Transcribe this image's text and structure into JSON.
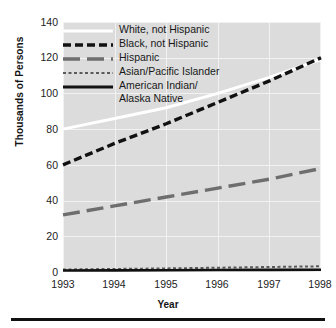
{
  "chart_data": {
    "type": "line",
    "title": "",
    "xlabel": "Year",
    "ylabel": "Thousands of Persons",
    "x": [
      1993,
      1994,
      1995,
      1996,
      1997,
      1998
    ],
    "xtick_labels": [
      "1993",
      "1994",
      "1995",
      "1996",
      "1997",
      "1998"
    ],
    "ytick_labels": [
      "0",
      "20",
      "40",
      "60",
      "80",
      "100",
      "120",
      "140"
    ],
    "yticks": [
      0,
      20,
      40,
      60,
      80,
      100,
      120,
      140
    ],
    "ylim": [
      0,
      140
    ],
    "xlim": [
      1993,
      1998
    ],
    "grid": true,
    "legend_position": "top-left-inside",
    "plot_background": "#dcdcdc",
    "series": [
      {
        "name": "White, not Hispanic",
        "values": [
          80,
          86,
          92,
          100,
          109,
          119
        ],
        "color": "#ffffff",
        "style": "solid",
        "width": 3
      },
      {
        "name": "Black, not Hispanic",
        "values": [
          60,
          72,
          83,
          95,
          107,
          120
        ],
        "color": "#111111",
        "style": "dashed",
        "width": 3.4
      },
      {
        "name": "Hispanic",
        "values": [
          32,
          37,
          42,
          47,
          52,
          58
        ],
        "color": "#6e6e6e",
        "style": "long-dash",
        "width": 3.4
      },
      {
        "name": "Asian/Pacific Islander",
        "values": [
          1.4,
          1.7,
          2.0,
          2.4,
          2.8,
          3.2
        ],
        "color": "#5a5a5a",
        "style": "dotted",
        "width": 2
      },
      {
        "name": "American Indian/\nAlaska Native",
        "values": [
          0.8,
          0.9,
          1.0,
          1.1,
          1.2,
          1.3
        ],
        "color": "#111111",
        "style": "solid",
        "width": 2.6
      }
    ]
  },
  "legend": {
    "items": [
      {
        "label": "White, not Hispanic",
        "label2": ""
      },
      {
        "label": "Black, not Hispanic",
        "label2": ""
      },
      {
        "label": "Hispanic",
        "label2": ""
      },
      {
        "label": "Asian/Pacific Islander",
        "label2": ""
      },
      {
        "label": "American Indian/",
        "label2": "Alaska Native"
      }
    ]
  },
  "axes": {
    "ylabel": "Thousands of Persons",
    "xlabel": "Year",
    "y": [
      "140",
      "120",
      "100",
      "80",
      "60",
      "40",
      "20",
      "0"
    ],
    "x": [
      "1993",
      "1994",
      "1995",
      "1996",
      "1997",
      "1998"
    ]
  }
}
